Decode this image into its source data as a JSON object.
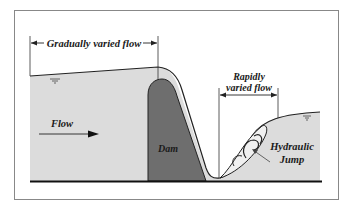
{
  "diagram": {
    "labels": {
      "gradually_varied": "Gradually varied flow",
      "rapidly_line1": "Rapidly",
      "rapidly_line2": "varied flow",
      "flow": "Flow",
      "dam": "Dam",
      "hydraulic_line1": "Hydraulic",
      "hydraulic_line2": "Jump"
    },
    "colors": {
      "water": "#dcdcdc",
      "dam": "#6e6e6e",
      "ground": "#111111",
      "frame": "#888888",
      "line": "#222222"
    }
  }
}
